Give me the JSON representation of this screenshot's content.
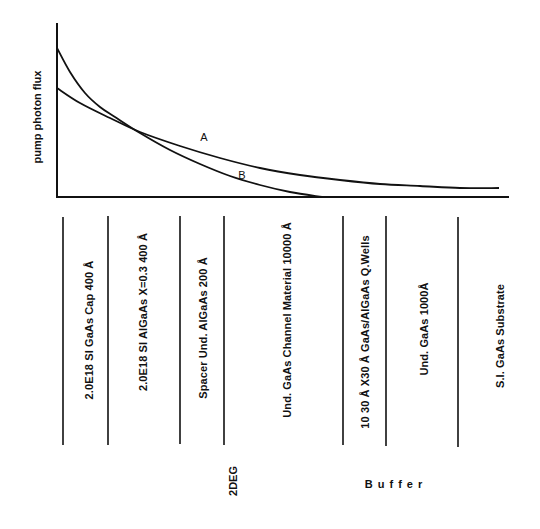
{
  "chart_data": {
    "type": "line",
    "title": "",
    "ylabel": "pump photon flux",
    "xlabel": "",
    "grid": false,
    "legend": "inline curve labels",
    "series": [
      {
        "name": "A",
        "description": "slower exponential decay, starts lower at surface, remains above B deeper",
        "points_px": [
          [
            57,
            88
          ],
          [
            80,
            103
          ],
          [
            110,
            118
          ],
          [
            140,
            132
          ],
          [
            180,
            146
          ],
          [
            220,
            158
          ],
          [
            260,
            168
          ],
          [
            300,
            175
          ],
          [
            340,
            180
          ],
          [
            380,
            184
          ],
          [
            420,
            186
          ],
          [
            460,
            188
          ],
          [
            499,
            188
          ]
        ]
      },
      {
        "name": "B",
        "description": "faster exponential decay, starts higher at surface, reaches zero near channel layer",
        "points_px": [
          [
            57,
            48
          ],
          [
            70,
            72
          ],
          [
            85,
            93
          ],
          [
            100,
            107
          ],
          [
            115,
            117
          ],
          [
            140,
            133
          ],
          [
            170,
            150
          ],
          [
            200,
            164
          ],
          [
            230,
            176
          ],
          [
            260,
            185
          ],
          [
            290,
            192
          ],
          [
            322,
            197
          ]
        ]
      }
    ],
    "crossing_point_px": [
      110,
      117
    ]
  },
  "axes": {
    "ylabel": "pump photon flux",
    "curve_labels": {
      "a": "A",
      "b": "B"
    }
  },
  "layers": [
    {
      "label": "2.0E18 SI  GaAs  Cap  400 Å"
    },
    {
      "label": "2.0E18 SI   AlGaAs   X=0.3  400 Å"
    },
    {
      "label": "Spacer  Und.  AlGaAs  200 Å"
    },
    {
      "label": "Und.  GaAs  Channel Material  10000 Å"
    },
    {
      "label": "10   30 Å X30 Å  GaAs/AlGaAs  Q.Wells"
    },
    {
      "label": "Und.  GaAs   1000Å"
    },
    {
      "label": "S.I.  GaAs  Substrate"
    }
  ],
  "groups": {
    "twodeg": "2DEG",
    "buffer": "Buffer"
  }
}
